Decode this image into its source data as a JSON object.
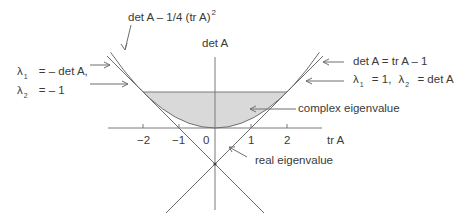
{
  "diagram": {
    "type": "trace-determinant plane",
    "axes": {
      "x_label": "tr A",
      "y_label": "det A",
      "x_ticks": [
        "−2",
        "−1",
        "0",
        "1",
        "2"
      ]
    },
    "curves": {
      "parabola_label": "det A – 1/4 (tr A)",
      "parabola_exponent": "2"
    },
    "annotations": {
      "left_line_l1_sym": "λ",
      "left_line_l1_sub": "1",
      "left_line_l1_rest": "= – det A,",
      "left_line_l2_sym": "λ",
      "left_line_l2_sub": "2",
      "left_line_l2_rest": "= – 1",
      "right_line_eq": "det A = tr A – 1",
      "right_line_l1_sym": "λ",
      "right_line_l1_sub": "1",
      "right_line_l1_rest": "= 1,",
      "right_line_l2_sym": "λ",
      "right_line_l2_sub": "2",
      "right_line_l2_rest": "= det A",
      "complex_region": "complex eigenvalue",
      "real_region": "real eigenvalue"
    },
    "colors": {
      "line": "#6e6e6e",
      "shade": "#d9d9d9",
      "text": "#3a3a3a"
    }
  }
}
